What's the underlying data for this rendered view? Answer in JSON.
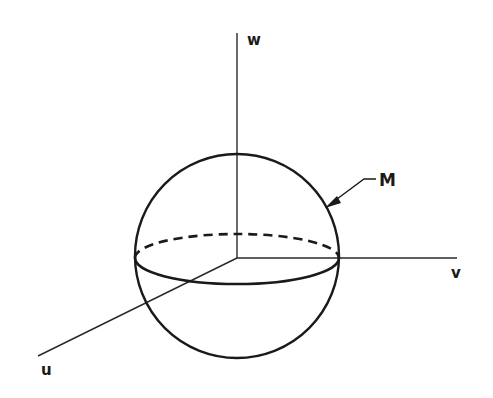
{
  "figure": {
    "type": "3D coordinate sphere diagram",
    "labels": {
      "w_axis": "w",
      "v_axis": "v",
      "u_axis": "u",
      "manifold": "M"
    },
    "elements": {
      "axes": [
        "w",
        "v",
        "u"
      ],
      "sphere": "sphere centered at origin",
      "equator_front": "solid",
      "equator_back": "dashed",
      "pointer": "arrow from label M to sphere surface"
    },
    "colors": {
      "ink": "#1a1a1a",
      "background": "#ffffff"
    }
  }
}
